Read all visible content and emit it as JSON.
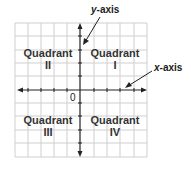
{
  "diagram": {
    "y_axis_label": {
      "var": "y",
      "suffix": "-axis"
    },
    "x_axis_label": {
      "var": "x",
      "suffix": "-axis"
    },
    "origin_label": "0",
    "quadrants": [
      {
        "line1": "Quadrant",
        "line2": "I"
      },
      {
        "line1": "Quadrant",
        "line2": "II"
      },
      {
        "line1": "Quadrant",
        "line2": "III"
      },
      {
        "line1": "Quadrant",
        "line2": "IV"
      }
    ],
    "colors": {
      "grid": "#cccccc",
      "axis": "#222222",
      "text": "#333333"
    }
  }
}
